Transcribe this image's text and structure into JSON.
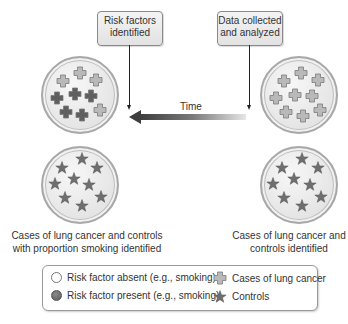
{
  "boxes": {
    "left": {
      "line1": "Risk factors",
      "line2": "identified"
    },
    "right": {
      "line1": "Data collected",
      "line2": "and analyzed"
    }
  },
  "time_label": "Time",
  "captions": {
    "left": {
      "line1": "Cases of lung cancer and controls",
      "line2": "with proportion smoking identified"
    },
    "right": {
      "line1": "Cases of lung cancer and",
      "line2": "controls identified"
    }
  },
  "legend": {
    "absent": "Risk factor absent (e.g., smoking)",
    "present": "Risk factor present (e.g., smoking)",
    "cases": "Cases of lung cancer",
    "controls": "Controls"
  },
  "colors": {
    "light_glyph": "#b9b9b9",
    "dark_glyph": "#5f5f5f",
    "star": "#6e6e6e"
  },
  "groups": {
    "left_cases": {
      "total": 9,
      "risk_present": 5,
      "risk_absent": 4
    },
    "right_cases": {
      "total": 9,
      "risk_present": 0,
      "risk_absent": 9
    },
    "left_controls": {
      "total": 10
    },
    "right_controls": {
      "total": 10
    }
  }
}
